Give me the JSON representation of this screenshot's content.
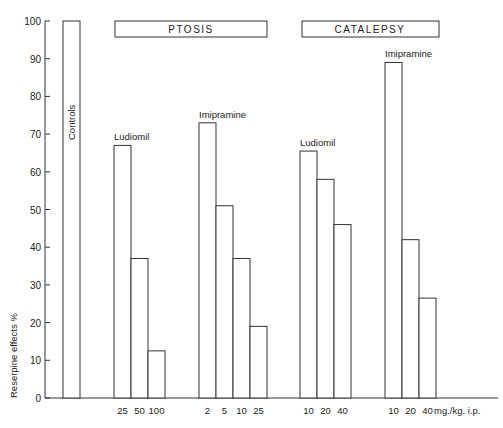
{
  "chart_data": {
    "type": "bar",
    "title": "",
    "ylabel": "Reserpine effects %",
    "xlabel": "mg./kg. i.p.",
    "ylim": [
      0,
      100
    ],
    "yticks": [
      0,
      10,
      20,
      30,
      40,
      50,
      60,
      70,
      80,
      90,
      100
    ],
    "grid": false,
    "panels": [
      {
        "name": "PTOSIS",
        "groups": [
          {
            "name": "Ludiomil",
            "doses": [
              "25",
              "50",
              "100"
            ],
            "values": [
              67,
              37,
              12.5
            ]
          },
          {
            "name": "Imipramine",
            "doses": [
              "2",
              "5",
              "10",
              "25"
            ],
            "values": [
              73,
              51,
              37,
              19
            ]
          }
        ]
      },
      {
        "name": "CATALEPSY",
        "groups": [
          {
            "name": "Ludiomil",
            "doses": [
              "10",
              "20",
              "40"
            ],
            "values": [
              65.5,
              58,
              46
            ]
          },
          {
            "name": "Imipramine",
            "doses": [
              "10",
              "20",
              "40"
            ],
            "values": [
              89,
              42,
              26.5
            ]
          }
        ]
      }
    ],
    "controls": {
      "name": "Controls",
      "value": 100
    }
  },
  "labels": {
    "ylabel": "Reserpine effects %",
    "units": "mg./kg. i.p.",
    "controls": "Controls",
    "ptosis": "PTOSIS",
    "catalepsy": "CATALEPSY",
    "ludiomil": "Ludiomil",
    "imipramine": "Imipramine"
  }
}
